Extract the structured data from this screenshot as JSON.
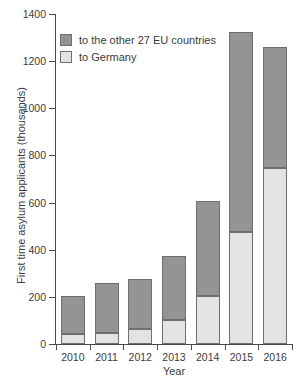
{
  "chart_data": {
    "type": "bar",
    "subtype": "stacked-bar",
    "title": "",
    "subtitle": "",
    "xlabel": "Year",
    "ylabel": "First time asylum applicants (thousands)",
    "categories": [
      "2010",
      "2011",
      "2012",
      "2013",
      "2014",
      "2015",
      "2016"
    ],
    "series": [
      {
        "name": "to Germany",
        "color": "#e3e3e3",
        "values": [
          41,
          46,
          64,
          100,
          203,
          476,
          745
        ]
      },
      {
        "name": "to the other 27 EU countries",
        "color": "#949494",
        "values": [
          164,
          214,
          213,
          275,
          404,
          846,
          515
        ]
      }
    ],
    "totals": [
      205,
      260,
      277,
      375,
      607,
      1322,
      1260
    ],
    "stack_order_bottom_to_top": [
      "to Germany",
      "to the other 27 EU countries"
    ],
    "ylim": [
      0,
      1400
    ],
    "y_ticks": [
      0,
      200,
      400,
      600,
      800,
      1000,
      1200,
      1400
    ],
    "y_tick_labels": [
      "0",
      "200",
      "400",
      "600",
      "800",
      "1000",
      "1200",
      "1400"
    ],
    "grid": false,
    "legend_position": "top-left",
    "legend_entries": [
      {
        "label": "to the other 27 EU countries",
        "color": "#949494"
      },
      {
        "label": "to Germany",
        "color": "#e3e3e3"
      }
    ]
  },
  "colors": {
    "other_eu": "#949494",
    "germany": "#e3e3e3",
    "bar_outline": "#6f6f6f",
    "axis": "#4a4a4a",
    "text": "#3c3c3c",
    "background": "#ffffff"
  }
}
